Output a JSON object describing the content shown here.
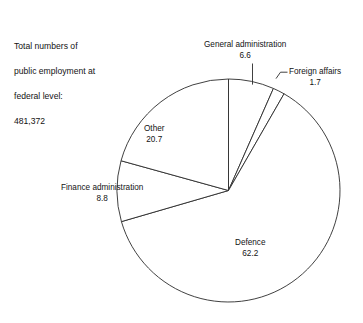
{
  "caption": {
    "lines": [
      "Total numbers of",
      "public employment at",
      "federal level:",
      "481,372"
    ],
    "line0": "Total numbers of",
    "line1": "public employment at",
    "line2": "federal level:",
    "line3": "481,372"
  },
  "chart_data": {
    "type": "pie",
    "title": "Total numbers of public employment at federal level: 481,372",
    "total_label": "481,372",
    "total_value": 481372,
    "unit": "percent",
    "start_angle_deg": 0,
    "direction": "clockwise",
    "legend": "none (direct labels)",
    "grid": false,
    "categories": [
      "General administration",
      "Foreign affairs",
      "Defence",
      "Finance administration",
      "Other"
    ],
    "values": [
      6.6,
      1.7,
      62.2,
      8.8,
      20.7
    ],
    "slices": [
      {
        "label": "General administration",
        "value": 6.6,
        "value_text": "6.6",
        "label_placement": "outside-top",
        "leader": true
      },
      {
        "label": "Foreign affairs",
        "value": 1.7,
        "value_text": "1.7",
        "label_placement": "outside-right",
        "leader": true
      },
      {
        "label": "Defence",
        "value": 62.2,
        "value_text": "62.2",
        "label_placement": "inside",
        "leader": false
      },
      {
        "label": "Finance administration",
        "value": 8.8,
        "value_text": "8.8",
        "label_placement": "inside",
        "leader": false
      },
      {
        "label": "Other",
        "value": 20.7,
        "value_text": "20.7",
        "label_placement": "inside",
        "leader": false
      }
    ],
    "colors": {
      "slice_fill": "#ffffff",
      "slice_stroke": "#2b2b2b",
      "text": "#131313",
      "background": "#ffffff"
    }
  }
}
